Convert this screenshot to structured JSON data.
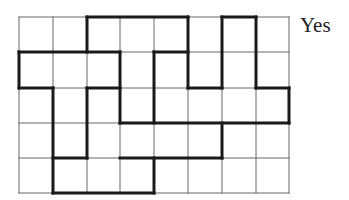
{
  "figure": {
    "label": "Yes",
    "grid": {
      "cols": 8,
      "rows": 5,
      "x_lines": [
        19,
        53,
        87,
        120,
        154,
        188,
        222,
        256,
        289
      ],
      "y_lines": [
        17,
        52,
        88,
        123,
        158,
        193
      ],
      "thin_color": "#666666",
      "bold_color": "#1a1a1a"
    },
    "bold_segments": [
      {
        "orient": "h",
        "at": 0,
        "from": 2,
        "to": 5
      },
      {
        "orient": "h",
        "at": 0,
        "from": 6,
        "to": 7
      },
      {
        "orient": "v",
        "at": 2,
        "from": 0,
        "to": 1
      },
      {
        "orient": "v",
        "at": 5,
        "from": 0,
        "to": 2
      },
      {
        "orient": "v",
        "at": 6,
        "from": 0,
        "to": 2
      },
      {
        "orient": "v",
        "at": 7,
        "from": 0,
        "to": 2
      },
      {
        "orient": "h",
        "at": 1,
        "from": 0,
        "to": 3
      },
      {
        "orient": "h",
        "at": 1,
        "from": 4,
        "to": 5
      },
      {
        "orient": "v",
        "at": 0,
        "from": 1,
        "to": 2
      },
      {
        "orient": "v",
        "at": 3,
        "from": 1,
        "to": 3
      },
      {
        "orient": "v",
        "at": 4,
        "from": 1,
        "to": 3
      },
      {
        "orient": "h",
        "at": 2,
        "from": 0,
        "to": 1
      },
      {
        "orient": "h",
        "at": 2,
        "from": 2,
        "to": 3
      },
      {
        "orient": "h",
        "at": 2,
        "from": 5,
        "to": 6
      },
      {
        "orient": "h",
        "at": 2,
        "from": 7,
        "to": 8
      },
      {
        "orient": "v",
        "at": 1,
        "from": 2,
        "to": 5
      },
      {
        "orient": "v",
        "at": 2,
        "from": 2,
        "to": 4
      },
      {
        "orient": "v",
        "at": 8,
        "from": 2,
        "to": 3
      },
      {
        "orient": "h",
        "at": 3,
        "from": 3,
        "to": 8
      },
      {
        "orient": "v",
        "at": 6,
        "from": 3,
        "to": 4
      },
      {
        "orient": "h",
        "at": 4,
        "from": 1,
        "to": 2
      },
      {
        "orient": "h",
        "at": 4,
        "from": 3,
        "to": 6
      },
      {
        "orient": "v",
        "at": 4,
        "from": 4,
        "to": 5
      },
      {
        "orient": "h",
        "at": 5,
        "from": 1,
        "to": 4
      }
    ]
  }
}
